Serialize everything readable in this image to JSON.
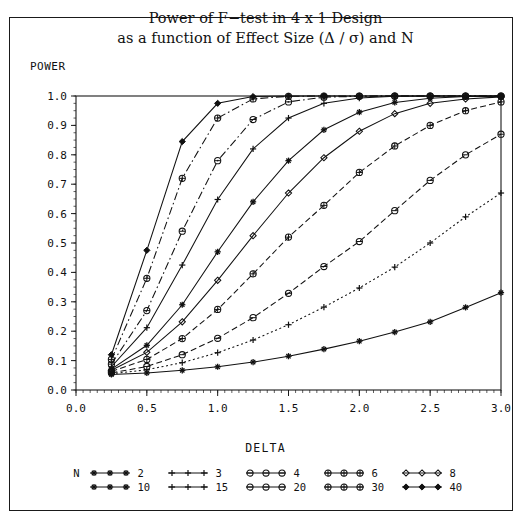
{
  "title": {
    "line1": "Power of F−test in 4 x 1 Design",
    "line2": "as a function of Effect Size (Δ / σ) and N"
  },
  "axes": {
    "ylabel": "POWER",
    "xlabel": "DELTA",
    "yticks": [
      "0.0",
      "0.1",
      "0.2",
      "0.3",
      "0.4",
      "0.5",
      "0.6",
      "0.7",
      "0.8",
      "0.9",
      "1.0"
    ],
    "xticks": [
      "0.0",
      "0.5",
      "1.0",
      "1.5",
      "2.0",
      "2.5",
      "3.0"
    ]
  },
  "legend": {
    "title": "N",
    "row1": [
      {
        "label": "2",
        "marker": "star-marker",
        "dash": "none"
      },
      {
        "label": "3",
        "marker": "plus-marker",
        "dash": "none"
      },
      {
        "label": "4",
        "marker": "circle-dash-marker",
        "dash": "none"
      },
      {
        "label": "6",
        "marker": "circle-plus-marker",
        "dash": "none"
      },
      {
        "label": "8",
        "marker": "diamond-open-marker",
        "dash": "none"
      }
    ],
    "row2": [
      {
        "label": "10",
        "marker": "star-marker",
        "dash": "none"
      },
      {
        "label": "15",
        "marker": "plus-marker",
        "dash": "none"
      },
      {
        "label": "20",
        "marker": "circle-dash-marker",
        "dash": "none"
      },
      {
        "label": "30",
        "marker": "circle-plus-marker",
        "dash": "none"
      },
      {
        "label": "40",
        "marker": "diamond-filled-marker",
        "dash": "none"
      }
    ]
  },
  "chart_data": {
    "type": "line",
    "xlabel": "DELTA",
    "ylabel": "POWER",
    "xlim": [
      0.0,
      3.0
    ],
    "ylim": [
      0.0,
      1.0
    ],
    "grid": false,
    "legend_position": "below-axes",
    "x": [
      0.25,
      0.5,
      0.75,
      1.0,
      1.25,
      1.5,
      1.75,
      2.0,
      2.25,
      2.5,
      2.75,
      3.0
    ],
    "series": [
      {
        "name": "2",
        "marker": "star-marker",
        "dash": "solid",
        "values": [
          0.053,
          0.058,
          0.067,
          0.079,
          0.095,
          0.115,
          0.139,
          0.166,
          0.197,
          0.232,
          0.281,
          0.331
        ]
      },
      {
        "name": "3",
        "marker": "plus-marker",
        "dash": "dotted",
        "values": [
          0.055,
          0.069,
          0.093,
          0.127,
          0.17,
          0.222,
          0.282,
          0.347,
          0.418,
          0.5,
          0.589,
          0.67
        ]
      },
      {
        "name": "4",
        "marker": "circle-dash-marker",
        "dash": "dashed",
        "values": [
          0.058,
          0.08,
          0.12,
          0.176,
          0.246,
          0.329,
          0.42,
          0.505,
          0.61,
          0.713,
          0.8,
          0.87
        ]
      },
      {
        "name": "6",
        "marker": "circle-plus-marker",
        "dash": "dashed",
        "values": [
          0.063,
          0.104,
          0.175,
          0.274,
          0.395,
          0.52,
          0.628,
          0.74,
          0.83,
          0.9,
          0.95,
          0.98
        ]
      },
      {
        "name": "8",
        "marker": "diamond-open-marker",
        "dash": "solid",
        "values": [
          0.067,
          0.128,
          0.232,
          0.373,
          0.525,
          0.67,
          0.79,
          0.88,
          0.94,
          0.975,
          0.99,
          0.997
        ]
      },
      {
        "name": "10",
        "marker": "star-marker",
        "dash": "solid",
        "values": [
          0.071,
          0.152,
          0.29,
          0.47,
          0.64,
          0.78,
          0.885,
          0.945,
          0.978,
          0.992,
          0.998,
          0.999
        ]
      },
      {
        "name": "15",
        "marker": "plus-marker",
        "dash": "solid",
        "values": [
          0.079,
          0.212,
          0.425,
          0.648,
          0.82,
          0.925,
          0.975,
          0.993,
          0.999,
          1.0,
          1.0,
          1.0
        ]
      },
      {
        "name": "20",
        "marker": "circle-dash-marker",
        "dash": "dash-dot",
        "values": [
          0.088,
          0.27,
          0.54,
          0.78,
          0.92,
          0.98,
          0.996,
          0.999,
          1.0,
          1.0,
          1.0,
          1.0
        ]
      },
      {
        "name": "30",
        "marker": "circle-plus-marker",
        "dash": "dash-dot",
        "values": [
          0.104,
          0.38,
          0.72,
          0.925,
          0.99,
          0.999,
          1.0,
          1.0,
          1.0,
          1.0,
          1.0,
          1.0
        ]
      },
      {
        "name": "40",
        "marker": "diamond-filled-marker",
        "dash": "solid",
        "values": [
          0.12,
          0.475,
          0.845,
          0.975,
          0.998,
          1.0,
          1.0,
          1.0,
          1.0,
          1.0,
          1.0,
          1.0
        ]
      }
    ]
  }
}
